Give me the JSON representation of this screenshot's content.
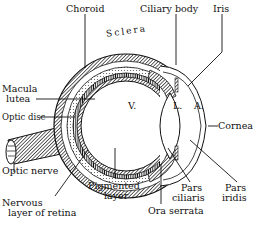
{
  "labels": {
    "choroid": "Choroid",
    "ciliary_body": "Ciliary body",
    "iris": "Iris",
    "sclera": "Sclera",
    "macula_lutea_1": "Macula",
    "macula_lutea_2": "lutea",
    "optic_disc": "Optic disc",
    "optic_nerve": "Optic nerve",
    "nervous_layer_1": "Nervous",
    "nervous_layer_2": "layer of retina",
    "pigmented_layer_1": "Pigmented",
    "pigmented_layer_2": "layer",
    "ora_serrata": "Ora serrata",
    "pars_ciliaris_1": "Pars",
    "pars_ciliaris_2": "ciliaris",
    "pars_iridis_1": "Pars",
    "pars_iridis_2": "iridis",
    "cornea": "Cornea",
    "vitreous": "V.",
    "lens": "L.",
    "anterior_chamber": "A."
  },
  "colors": {
    "ink": "#111111",
    "paper": "#ffffff"
  }
}
